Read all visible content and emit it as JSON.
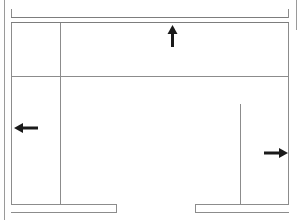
{
  "drawing": {
    "title": "Floor plan line drawing with direction arrows",
    "width": 300,
    "height": 220,
    "background_color": "#ffffff",
    "line_color": "#8c8c8c",
    "line_color_dark": "#6e6e6e",
    "arrow_color": "#1a1a1a",
    "stroke_width": 1,
    "elements": {
      "outer_frame_left_label": "",
      "outer_frame_right_label": "",
      "top_bracket_label": "",
      "inner_room_label": "",
      "divider_vertical_label": "",
      "divider_horizontal_label": "",
      "right_partition_label": "",
      "bottom_bar_left_label": "",
      "bottom_bar_right_label": ""
    },
    "arrows": [
      {
        "name": "arrow-up",
        "direction": "up",
        "x": 173,
        "y": 36,
        "length": 21,
        "label": ""
      },
      {
        "name": "arrow-left",
        "direction": "left",
        "x": 26,
        "y": 128,
        "length": 24,
        "label": ""
      },
      {
        "name": "arrow-right",
        "direction": "right",
        "x": 276,
        "y": 153,
        "length": 24,
        "label": ""
      }
    ]
  }
}
